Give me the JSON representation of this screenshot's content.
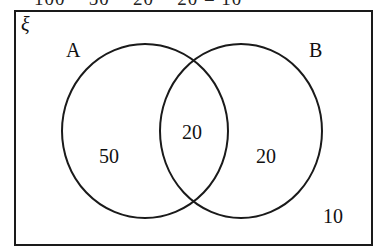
{
  "header": {
    "equation": "100 − 50 − 20 − 20 = 10"
  },
  "diagram": {
    "universal_symbol": "ξ",
    "sets": [
      {
        "name": "A",
        "only_count": "50"
      },
      {
        "name": "B",
        "only_count": "20"
      }
    ],
    "intersection_count": "20",
    "outside_count": "10",
    "stroke_color": "#1a1a1a"
  }
}
